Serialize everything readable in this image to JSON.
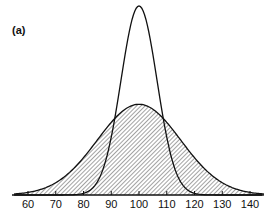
{
  "chart_data": {
    "type": "line",
    "title": "",
    "panel_label": "(a)",
    "xlabel": "",
    "ylabel": "",
    "xlim": [
      55,
      145
    ],
    "x_ticks": [
      60,
      70,
      80,
      90,
      100,
      110,
      120,
      130,
      140
    ],
    "grid": false,
    "legend": null,
    "series": [
      {
        "name": "narrow distribution",
        "style": "solid outline, unfilled",
        "distribution": "normal",
        "mean": 100,
        "sd": 6.5,
        "relative_peak_height": 1.0
      },
      {
        "name": "broad distribution",
        "style": "solid outline, diagonal hatched fill",
        "distribution": "normal",
        "mean": 100,
        "sd": 15,
        "relative_peak_height": 0.48
      }
    ]
  },
  "colors": {
    "line": "#111111",
    "hatch": "#333333",
    "background": "#ffffff"
  }
}
